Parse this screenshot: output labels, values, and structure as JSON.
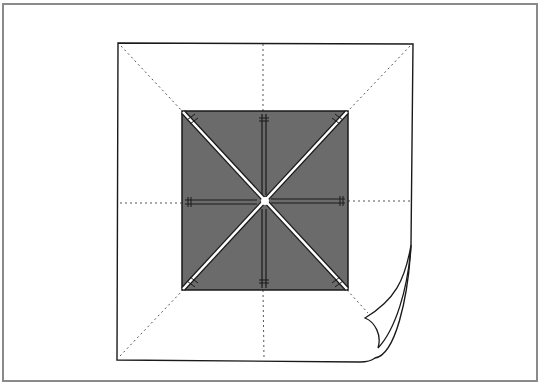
{
  "diagram": {
    "colors": {
      "frame": "#8a8a8a",
      "fabric": "#ffffff",
      "center_square": "#6b6b6b",
      "outline": "#1a1a1a",
      "fold_lines": "#555555"
    },
    "elements": [
      "outer-fabric-square",
      "center-dark-square",
      "diagonal-seams",
      "center-cross-seams",
      "dotted-fold-lines",
      "curled-corner"
    ]
  }
}
